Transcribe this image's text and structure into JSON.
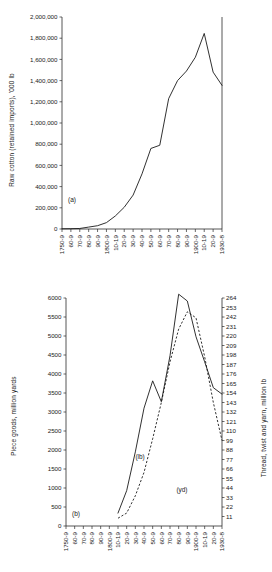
{
  "figure": {
    "panel_a_tag": "(a)",
    "panel_b_tag": "(b)",
    "curve_tag_lb": "(lb)",
    "curve_tag_yd": "(yd)"
  },
  "chart_data": [
    {
      "type": "line",
      "panel": "(a)",
      "title": "",
      "xlabel": "",
      "ylabel": "Raw cotton (retained imports), '000 lb",
      "ylim": [
        0,
        2000000
      ],
      "ytick_labels": [
        "0",
        "200,000",
        "400,000",
        "600,000",
        "800,000",
        "1,000,000",
        "1,200,000",
        "1,400,000",
        "1,600,000",
        "1,800,000",
        "2,000,000"
      ],
      "ytick_values": [
        0,
        200000,
        400000,
        600000,
        800000,
        1000000,
        1200000,
        1400000,
        1600000,
        1800000,
        2000000
      ],
      "grid": false,
      "legend": "none",
      "categories": [
        "1750-9",
        "60-9",
        "70-9",
        "80-9",
        "90-9",
        "1800-9",
        "10-19",
        "20-9",
        "30-9",
        "40-9",
        "50-9",
        "60-9",
        "70-9",
        "80-9",
        "90-9",
        "1900-9",
        "10-19",
        "20-9",
        "1930-8"
      ],
      "series": [
        {
          "name": "Raw cotton (retained imports)",
          "style": "solid",
          "values": [
            2000,
            3000,
            5000,
            18000,
            31000,
            60000,
            123000,
            205000,
            320000,
            520000,
            760000,
            790000,
            1230000,
            1400000,
            1490000,
            1620000,
            1845000,
            1480000,
            1355000
          ]
        }
      ]
    },
    {
      "type": "line",
      "panel": "(b)",
      "title": "",
      "xlabel": "",
      "ylabel": "Piece goods, million yards",
      "ylabel_right": "Thread, twist and yarn, million lb",
      "ylim": [
        0,
        6000
      ],
      "ytick_labels": [
        "0",
        "500",
        "1000",
        "1500",
        "2000",
        "2500",
        "3000",
        "3500",
        "4000",
        "4500",
        "5000",
        "5500",
        "6000"
      ],
      "ytick_values": [
        0,
        500,
        1000,
        1500,
        2000,
        2500,
        3000,
        3500,
        4000,
        4500,
        5000,
        5500,
        6000
      ],
      "ylim_right": [
        0,
        264
      ],
      "ytick_labels_right": [
        "11",
        "22",
        "33",
        "44",
        "55",
        "66",
        "77",
        "88",
        "99",
        "110",
        "121",
        "132",
        "143",
        "154",
        "165",
        "176",
        "187",
        "198",
        "209",
        "220",
        "231",
        "242",
        "253",
        "264"
      ],
      "ytick_values_right": [
        11,
        22,
        33,
        44,
        55,
        66,
        77,
        88,
        99,
        110,
        121,
        132,
        143,
        154,
        165,
        176,
        187,
        198,
        209,
        220,
        231,
        242,
        253,
        264
      ],
      "grid": false,
      "legend": "inline-labels",
      "categories": [
        "1750-9",
        "60-9",
        "70-9",
        "80-9",
        "90-9",
        "1800-9",
        "10-19",
        "20-9",
        "30-9",
        "40-9",
        "50-9",
        "60-9",
        "70-9",
        "80-9",
        "90-9",
        "1900-9",
        "10-19",
        "20-9",
        "1930-8"
      ],
      "series": [
        {
          "name": "Piece goods (yd)",
          "style": "solid",
          "axis": "left",
          "label": "(lb)",
          "values": [
            null,
            null,
            null,
            null,
            null,
            null,
            340,
            930,
            1950,
            3100,
            3820,
            3270,
            4480,
            6100,
            5920,
            4980,
            4320,
            3640,
            3470
          ]
        },
        {
          "name": "Thread, twist and yarn (lb)",
          "style": "dashed",
          "axis": "right",
          "label": "(yd)",
          "values": [
            null,
            null,
            null,
            null,
            null,
            null,
            9,
            15,
            35,
            62,
            101,
            143,
            190,
            228,
            248,
            241,
            196,
            143,
            99
          ]
        }
      ]
    }
  ]
}
